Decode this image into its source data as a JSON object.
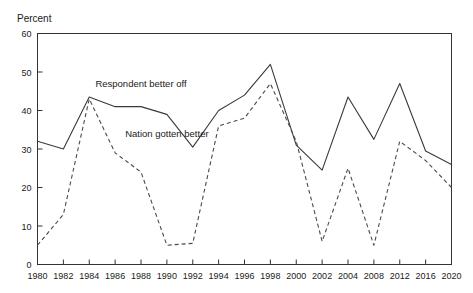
{
  "figure": {
    "top_note": "",
    "axis_title": "Percent"
  },
  "chart_data": {
    "type": "line",
    "title": "",
    "subtitle": "",
    "xlabel": "",
    "ylabel": "Percent",
    "ylim": [
      0,
      60
    ],
    "ytick_step": 10,
    "yticks": [
      0,
      10,
      20,
      30,
      40,
      50,
      60
    ],
    "grid": false,
    "legend_position": "inline-annotation",
    "categories": [
      "1980",
      "1982",
      "1984",
      "1986",
      "1988",
      "1990",
      "1992",
      "1994",
      "1996",
      "1998",
      "2000",
      "2002",
      "2004",
      "2008",
      "2012",
      "2016",
      "2020"
    ],
    "series": [
      {
        "name": "Respondent better off",
        "style": "solid",
        "values": [
          32,
          30,
          43.5,
          41,
          41,
          39,
          30.5,
          40,
          44,
          52,
          31,
          24.5,
          43.5,
          32.5,
          47,
          29.5,
          26
        ]
      },
      {
        "name": "Nation gotten better",
        "style": "dashed",
        "values": [
          5,
          13,
          43,
          29,
          24,
          5,
          5.5,
          36,
          38,
          47,
          32,
          6,
          25,
          5,
          32,
          27,
          20
        ]
      }
    ],
    "annotations": [
      {
        "text": "Respondent better off",
        "x_category": "1988",
        "y_value": 46
      },
      {
        "text": "Nation gotten better",
        "x_category": "1990",
        "y_value": 33
      }
    ]
  }
}
